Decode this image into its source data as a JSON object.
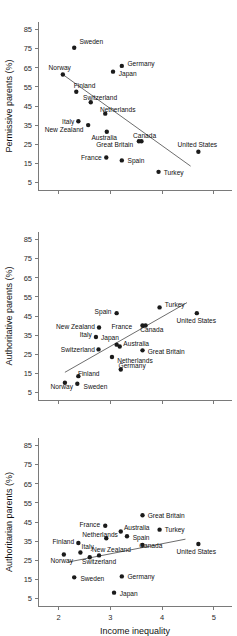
{
  "figure": {
    "xlabel": "Income inequality",
    "x_ticks": [
      2,
      3,
      4,
      5
    ],
    "y_ticks": [
      5,
      15,
      25,
      35,
      45,
      55,
      65,
      75,
      85
    ],
    "point_color": "#1b1b1b",
    "trend_color": "#6e6e6e",
    "axis_color": "#7a7a7a",
    "background": "#ffffff"
  },
  "chart_data": [
    {
      "type": "scatter",
      "title": "",
      "xlabel": "",
      "ylabel": "Permissive parents (%)",
      "xlim": [
        1.6,
        5.35
      ],
      "ylim": [
        1,
        89
      ],
      "xticks": [
        2,
        3,
        4,
        5
      ],
      "yticks": [
        5,
        15,
        25,
        35,
        45,
        55,
        65,
        75,
        85
      ],
      "grid": false,
      "legend": "none",
      "trendline": {
        "x0": 2.08,
        "y0": 61.5,
        "x1": 4.55,
        "y1": 13.5
      },
      "points": [
        {
          "label": "Sweden",
          "x": 2.3,
          "y": 75.5,
          "lx": 2.4,
          "ly": 78.5,
          "anchor": "rt"
        },
        {
          "label": "Norway",
          "x": 2.08,
          "y": 61.5,
          "lx": 2.02,
          "ly": 65.0,
          "anchor": "mid"
        },
        {
          "label": "Germany",
          "x": 3.22,
          "y": 66.0,
          "lx": 3.33,
          "ly": 67.0,
          "anchor": "rt"
        },
        {
          "label": "Japan",
          "x": 3.05,
          "y": 63.0,
          "lx": 3.16,
          "ly": 62.0,
          "anchor": "rt"
        },
        {
          "label": "Finland",
          "x": 2.34,
          "y": 52.5,
          "lx": 2.5,
          "ly": 55.5,
          "anchor": "mid"
        },
        {
          "label": "Switzerland",
          "x": 2.62,
          "y": 47.0,
          "lx": 2.8,
          "ly": 49.5,
          "anchor": "mid"
        },
        {
          "label": "Netherlands",
          "x": 2.9,
          "y": 41.0,
          "lx": 3.14,
          "ly": 43.0,
          "anchor": "mid"
        },
        {
          "label": "Italy",
          "x": 2.38,
          "y": 37.0,
          "lx": 2.3,
          "ly": 37.0,
          "anchor": "lt"
        },
        {
          "label": "New Zealand",
          "x": 2.57,
          "y": 35.0,
          "lx": 2.48,
          "ly": 32.5,
          "anchor": "lt"
        },
        {
          "label": "Australia",
          "x": 2.93,
          "y": 31.5,
          "lx": 2.88,
          "ly": 28.5,
          "anchor": "mid"
        },
        {
          "label": "Canada",
          "x": 3.6,
          "y": 26.5,
          "lx": 3.66,
          "ly": 29.5,
          "anchor": "mid"
        },
        {
          "label": "Great Britain",
          "x": 3.55,
          "y": 26.5,
          "lx": 3.44,
          "ly": 25.0,
          "anchor": "lt"
        },
        {
          "label": "United States",
          "x": 4.7,
          "y": 21.0,
          "lx": 4.68,
          "ly": 25.0,
          "anchor": "mid"
        },
        {
          "label": "France",
          "x": 2.92,
          "y": 18.0,
          "lx": 2.83,
          "ly": 18.0,
          "anchor": "lt"
        },
        {
          "label": "Spain",
          "x": 3.22,
          "y": 16.5,
          "lx": 3.33,
          "ly": 16.5,
          "anchor": "rt"
        },
        {
          "label": "Turkey",
          "x": 3.93,
          "y": 10.5,
          "lx": 4.03,
          "ly": 10.0,
          "anchor": "rt"
        }
      ]
    },
    {
      "type": "scatter",
      "title": "",
      "xlabel": "",
      "ylabel": "Authoritative parents (%)",
      "xlim": [
        1.6,
        5.35
      ],
      "ylim": [
        1,
        89
      ],
      "xticks": [
        2,
        3,
        4,
        5
      ],
      "yticks": [
        5,
        15,
        25,
        35,
        45,
        55,
        65,
        75,
        85
      ],
      "grid": false,
      "legend": "none",
      "trendline": {
        "x0": 2.12,
        "y0": 15.5,
        "x1": 4.48,
        "y1": 52.0
      },
      "points": [
        {
          "label": "Turkey",
          "x": 3.95,
          "y": 49.5,
          "lx": 4.05,
          "ly": 51.0,
          "anchor": "rt"
        },
        {
          "label": "United States",
          "x": 4.67,
          "y": 46.5,
          "lx": 4.66,
          "ly": 42.5,
          "anchor": "mid"
        },
        {
          "label": "Spain",
          "x": 3.12,
          "y": 46.5,
          "lx": 3.02,
          "ly": 47.5,
          "anchor": "lt"
        },
        {
          "label": "France",
          "x": 3.62,
          "y": 40.0,
          "lx": 3.22,
          "ly": 39.5,
          "anchor": "mid"
        },
        {
          "label": "Canada",
          "x": 3.68,
          "y": 40.0,
          "lx": 3.8,
          "ly": 38.0,
          "anchor": "mid"
        },
        {
          "label": "New Zealand",
          "x": 2.78,
          "y": 39.0,
          "lx": 2.7,
          "ly": 39.5,
          "anchor": "lt"
        },
        {
          "label": "Italy",
          "x": 2.72,
          "y": 34.0,
          "lx": 2.64,
          "ly": 35.0,
          "anchor": "lt"
        },
        {
          "label": "Japan",
          "x": 3.12,
          "y": 30.0,
          "lx": 2.99,
          "ly": 33.5,
          "anchor": "mid"
        },
        {
          "label": "Australia",
          "x": 3.18,
          "y": 29.0,
          "lx": 3.25,
          "ly": 30.5,
          "anchor": "rt"
        },
        {
          "label": "Switzerland",
          "x": 2.77,
          "y": 27.5,
          "lx": 2.7,
          "ly": 27.5,
          "anchor": "lt"
        },
        {
          "label": "Great Britain",
          "x": 3.62,
          "y": 27.0,
          "lx": 3.72,
          "ly": 26.5,
          "anchor": "rt"
        },
        {
          "label": "Netherlands",
          "x": 3.03,
          "y": 23.5,
          "lx": 3.13,
          "ly": 21.5,
          "anchor": "rt"
        },
        {
          "label": "Germany",
          "x": 3.2,
          "y": 17.0,
          "lx": 3.42,
          "ly": 19.0,
          "anchor": "mid"
        },
        {
          "label": "Finland",
          "x": 2.38,
          "y": 13.5,
          "lx": 2.58,
          "ly": 15.0,
          "anchor": "mid"
        },
        {
          "label": "Norway",
          "x": 2.12,
          "y": 10.0,
          "lx": 2.06,
          "ly": 8.0,
          "anchor": "mid"
        },
        {
          "label": "Sweden",
          "x": 2.36,
          "y": 9.5,
          "lx": 2.48,
          "ly": 8.0,
          "anchor": "rt"
        }
      ]
    },
    {
      "type": "scatter",
      "title": "",
      "xlabel": "Income inequality",
      "ylabel": "Authoritarian parents (%)",
      "xlim": [
        1.6,
        5.35
      ],
      "ylim": [
        1,
        89
      ],
      "xticks": [
        2,
        3,
        4,
        5
      ],
      "yticks": [
        5,
        15,
        25,
        35,
        45,
        55,
        65,
        75,
        85
      ],
      "grid": false,
      "legend": "none",
      "trendline": {
        "x0": 2.18,
        "y0": 24.0,
        "x1": 4.45,
        "y1": 36.0
      },
      "points": [
        {
          "label": "Great Britain",
          "x": 3.62,
          "y": 48.5,
          "lx": 3.72,
          "ly": 48.5,
          "anchor": "rt"
        },
        {
          "label": "France",
          "x": 2.9,
          "y": 43.0,
          "lx": 2.8,
          "ly": 43.5,
          "anchor": "lt"
        },
        {
          "label": "Australia",
          "x": 3.2,
          "y": 40.0,
          "lx": 3.26,
          "ly": 42.0,
          "anchor": "rt"
        },
        {
          "label": "Turkey",
          "x": 3.95,
          "y": 41.0,
          "lx": 4.05,
          "ly": 41.0,
          "anchor": "rt"
        },
        {
          "label": "Netherlands",
          "x": 2.92,
          "y": 36.5,
          "lx": 2.8,
          "ly": 38.5,
          "anchor": "mid"
        },
        {
          "label": "Spain",
          "x": 3.32,
          "y": 37.5,
          "lx": 3.43,
          "ly": 37.0,
          "anchor": "rt"
        },
        {
          "label": "Finland",
          "x": 2.38,
          "y": 34.0,
          "lx": 2.3,
          "ly": 34.5,
          "anchor": "lt"
        },
        {
          "label": "Italy",
          "x": 2.42,
          "y": 29.0,
          "lx": 2.56,
          "ly": 32.0,
          "anchor": "mid"
        },
        {
          "label": "New Zealand",
          "x": 2.78,
          "y": 27.5,
          "lx": 3.02,
          "ly": 30.5,
          "anchor": "mid"
        },
        {
          "label": "Canada",
          "x": 3.62,
          "y": 33.0,
          "lx": 3.78,
          "ly": 32.5,
          "anchor": "mid"
        },
        {
          "label": "United States",
          "x": 4.7,
          "y": 33.5,
          "lx": 4.66,
          "ly": 29.5,
          "anchor": "mid"
        },
        {
          "label": "Norway",
          "x": 2.1,
          "y": 28.0,
          "lx": 2.06,
          "ly": 25.0,
          "anchor": "mid"
        },
        {
          "label": "Switzerland",
          "x": 2.6,
          "y": 26.5,
          "lx": 2.78,
          "ly": 24.0,
          "anchor": "mid"
        },
        {
          "label": "Sweden",
          "x": 2.3,
          "y": 16.0,
          "lx": 2.42,
          "ly": 15.5,
          "anchor": "rt"
        },
        {
          "label": "Germany",
          "x": 3.22,
          "y": 16.5,
          "lx": 3.33,
          "ly": 16.5,
          "anchor": "rt"
        },
        {
          "label": "Japan",
          "x": 3.07,
          "y": 8.0,
          "lx": 3.18,
          "ly": 7.5,
          "anchor": "rt"
        }
      ]
    }
  ]
}
